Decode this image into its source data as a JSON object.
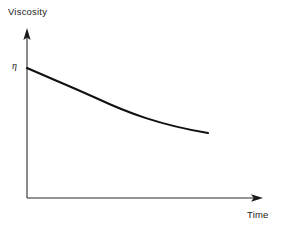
{
  "figure": {
    "background_color": "#ffffff",
    "line_color": "#111111",
    "axis_color": "#2b2b2b",
    "width": 283,
    "height": 230
  },
  "labels": {
    "y_axis": "Viscosity",
    "x_axis": "Time",
    "initial_value": "η",
    "top_fragment": ""
  },
  "chart_data": {
    "type": "line",
    "title": "",
    "xlabel": "Time",
    "ylabel": "Viscosity",
    "grid": false,
    "legend": null,
    "annotations": [
      {
        "text": "η",
        "description": "initial viscosity marked on the vertical axis at the curve's starting value",
        "x": 0,
        "y": 1.0
      }
    ],
    "axis_style": "arrow-terminated, no tick marks, no numeric scale",
    "xlim": [
      0,
      1.4
    ],
    "ylim": [
      0,
      1.18
    ],
    "series": [
      {
        "name": "Viscosity decay",
        "description": "Monotonically decreasing, convex (exponential-like) decay of viscosity with time",
        "x": [
          0.0,
          0.1,
          0.2,
          0.3,
          0.4,
          0.5,
          0.6,
          0.7,
          0.8,
          0.9,
          1.0,
          1.07
        ],
        "y": [
          1.0,
          0.935,
          0.878,
          0.827,
          0.782,
          0.742,
          0.707,
          0.676,
          0.649,
          0.625,
          0.605,
          0.594
        ]
      }
    ]
  },
  "geometry": {
    "origin": {
      "x": 27,
      "y": 198
    },
    "y_axis_top": {
      "x": 27,
      "y": 30
    },
    "x_axis_right": {
      "x": 262,
      "y": 198
    },
    "curve_path": "M 27,68 C 52,79 72,87 96,98 C 128,113 160,125 208,133",
    "curve_stroke_width": 2.1,
    "axis_stroke_width": 1.1
  }
}
